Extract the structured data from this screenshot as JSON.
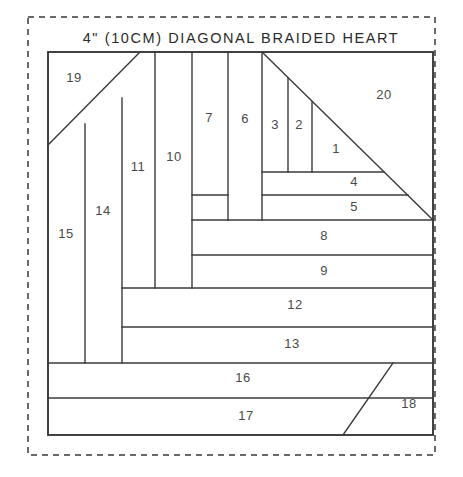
{
  "document": {
    "title": "4\" (10CM) DIAGONAL BRAIDED HEART",
    "title_x": 241,
    "title_y": 43,
    "background_color": "#ffffff",
    "line_color": "#3a3a3a",
    "label_color": "#4a4a4a"
  },
  "dashed_border": {
    "x": 28,
    "y": 17,
    "width": 407,
    "height": 438
  },
  "block": {
    "x": 48,
    "y": 52,
    "width": 385,
    "height": 383
  },
  "pieces": [
    {
      "id": "piece-1",
      "label": "1",
      "x": 336,
      "y": 150
    },
    {
      "id": "piece-2",
      "label": "2",
      "x": 299,
      "y": 126
    },
    {
      "id": "piece-3",
      "label": "3",
      "x": 275,
      "y": 126
    },
    {
      "id": "piece-4",
      "label": "4",
      "x": 354,
      "y": 183
    },
    {
      "id": "piece-5",
      "label": "5",
      "x": 354,
      "y": 208
    },
    {
      "id": "piece-6",
      "label": "6",
      "x": 245,
      "y": 120
    },
    {
      "id": "piece-7",
      "label": "7",
      "x": 209,
      "y": 119
    },
    {
      "id": "piece-8",
      "label": "8",
      "x": 324,
      "y": 237
    },
    {
      "id": "piece-9",
      "label": "9",
      "x": 324,
      "y": 272
    },
    {
      "id": "piece-10",
      "label": "10",
      "x": 174,
      "y": 158
    },
    {
      "id": "piece-11",
      "label": "11",
      "x": 138,
      "y": 168
    },
    {
      "id": "piece-12",
      "label": "12",
      "x": 295,
      "y": 306
    },
    {
      "id": "piece-13",
      "label": "13",
      "x": 292,
      "y": 345
    },
    {
      "id": "piece-14",
      "label": "14",
      "x": 103,
      "y": 212
    },
    {
      "id": "piece-15",
      "label": "15",
      "x": 66,
      "y": 235
    },
    {
      "id": "piece-16",
      "label": "16",
      "x": 243,
      "y": 379
    },
    {
      "id": "piece-17",
      "label": "17",
      "x": 246,
      "y": 417
    },
    {
      "id": "piece-18",
      "label": "18",
      "x": 409,
      "y": 405
    },
    {
      "id": "piece-19",
      "label": "19",
      "x": 74,
      "y": 79
    },
    {
      "id": "piece-20",
      "label": "20",
      "x": 384,
      "y": 96
    }
  ],
  "seam_lines": [
    {
      "name": "diagonal-heart-main",
      "x1": 262,
      "y1": 52,
      "x2": 433,
      "y2": 220
    },
    {
      "name": "diagonal-piece-19",
      "x1": 48,
      "y1": 145,
      "x2": 140,
      "y2": 52
    },
    {
      "name": "diagonal-piece-18",
      "x1": 343,
      "y1": 435,
      "x2": 393,
      "y2": 363
    },
    {
      "name": "vline-15-14",
      "x1": 85,
      "y1": 124,
      "x2": 85,
      "y2": 363
    },
    {
      "name": "vline-14-11",
      "x1": 122,
      "y1": 98,
      "x2": 122,
      "y2": 363
    },
    {
      "name": "vline-11-10",
      "x1": 155,
      "y1": 52,
      "x2": 155,
      "y2": 288
    },
    {
      "name": "vline-10-7",
      "x1": 192,
      "y1": 52,
      "x2": 192,
      "y2": 288
    },
    {
      "name": "vline-7-6",
      "x1": 228,
      "y1": 52,
      "x2": 228,
      "y2": 220
    },
    {
      "name": "vline-6-3",
      "x1": 262,
      "y1": 52,
      "x2": 262,
      "y2": 220
    },
    {
      "name": "vline-3-2",
      "x1": 288,
      "y1": 78,
      "x2": 288,
      "y2": 172
    },
    {
      "name": "vline-2-1",
      "x1": 312,
      "y1": 102,
      "x2": 312,
      "y2": 172
    },
    {
      "name": "hline-top-4",
      "x1": 262,
      "y1": 172,
      "x2": 384,
      "y2": 172
    },
    {
      "name": "hline-top-5",
      "x1": 262,
      "y1": 195,
      "x2": 408,
      "y2": 195
    },
    {
      "name": "hline-top-8",
      "x1": 192,
      "y1": 220,
      "x2": 433,
      "y2": 220
    },
    {
      "name": "hline-top-9",
      "x1": 192,
      "y1": 255,
      "x2": 433,
      "y2": 255
    },
    {
      "name": "hline-top-12",
      "x1": 122,
      "y1": 288,
      "x2": 433,
      "y2": 288
    },
    {
      "name": "hline-top-13",
      "x1": 122,
      "y1": 327,
      "x2": 433,
      "y2": 327
    },
    {
      "name": "hline-top-16",
      "x1": 48,
      "y1": 363,
      "x2": 433,
      "y2": 363
    },
    {
      "name": "hline-top-17",
      "x1": 48,
      "y1": 398,
      "x2": 433,
      "y2": 398
    },
    {
      "name": "hline-7-bottom",
      "x1": 192,
      "y1": 195,
      "x2": 228,
      "y2": 195
    }
  ]
}
